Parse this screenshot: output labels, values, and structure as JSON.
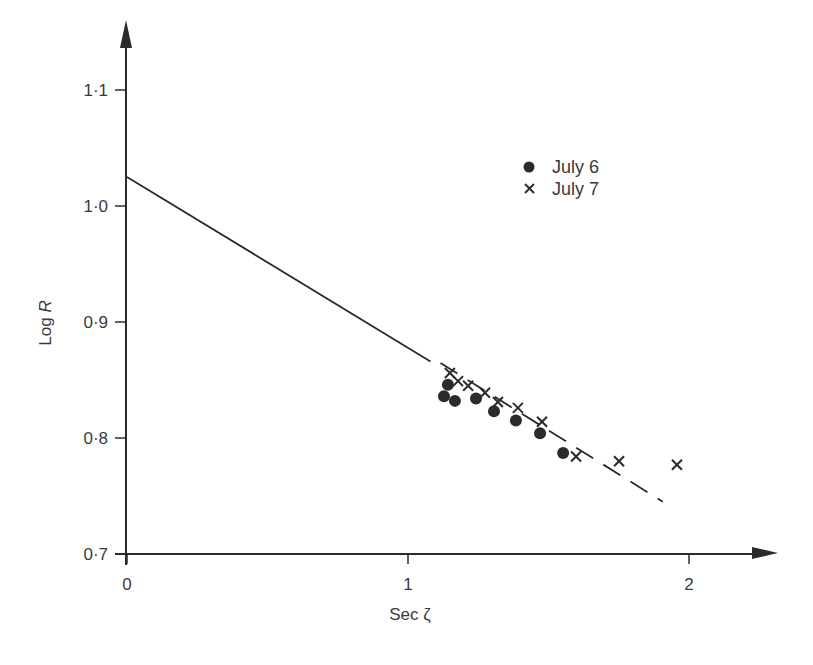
{
  "chart_data": {
    "type": "scatter",
    "title": "",
    "xlabel": "Sec ζ",
    "ylabel": "Log R",
    "xlim": [
      0,
      2.2
    ],
    "ylim": [
      0.7,
      1.14
    ],
    "grid": false,
    "legend_position": "upper right (inside)",
    "x_ticks": [
      0,
      1,
      2
    ],
    "x_tick_labels": [
      "0",
      "1",
      "2"
    ],
    "y_ticks": [
      0.7,
      0.8,
      0.9,
      1.0,
      1.1
    ],
    "y_tick_labels": [
      "0·7",
      "0·8",
      "0·9",
      "1·0",
      "1·1"
    ],
    "series": [
      {
        "name": "July 6",
        "marker": "filled-circle",
        "x": [
          1.128,
          1.142,
          1.167,
          1.242,
          1.306,
          1.384,
          1.47,
          1.552
        ],
        "y": [
          0.836,
          0.846,
          0.832,
          0.834,
          0.823,
          0.815,
          0.804,
          0.787
        ]
      },
      {
        "name": "July 7",
        "marker": "cross",
        "x": [
          1.149,
          1.178,
          1.214,
          1.274,
          1.32,
          1.391,
          1.477,
          1.598,
          1.751,
          1.957
        ],
        "y": [
          0.856,
          0.849,
          0.845,
          0.839,
          0.831,
          0.826,
          0.814,
          0.784,
          0.78,
          0.777
        ]
      }
    ],
    "fit_line": {
      "solid": {
        "x": [
          0,
          1.08
        ],
        "y": [
          1.025,
          0.866
        ]
      },
      "dashed": {
        "x": [
          1.08,
          1.907
        ],
        "y": [
          0.866,
          0.745
        ]
      }
    }
  },
  "legend": {
    "items": [
      {
        "label": "July 6",
        "marker": "dot"
      },
      {
        "label": "July 7",
        "marker": "cross"
      }
    ]
  },
  "axes": {
    "x_title": "Sec ζ",
    "y_title_prefix": "Log ",
    "y_title_var": "R"
  },
  "colors": {
    "ink": "#2b2b2b",
    "text": "#3a3a3a",
    "background": "#ffffff"
  }
}
